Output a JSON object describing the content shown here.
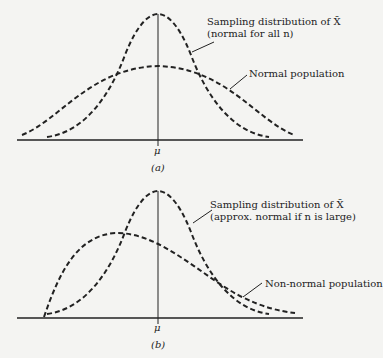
{
  "panels": [
    {
      "id": "a",
      "caption": "(a)",
      "axis_label": "μ",
      "sampling_label_line1": "Sampling distribution of X̄",
      "sampling_label_line2": "(normal for all n)",
      "population_label": "Normal population"
    },
    {
      "id": "b",
      "caption": "(b)",
      "axis_label": "μ",
      "sampling_label_line1": "Sampling distribution of X̄",
      "sampling_label_line2": "(approx. normal if n is large)",
      "population_label": "Non-normal population"
    }
  ],
  "colors": {
    "ink": "#222222",
    "background": "#f4f4f2"
  }
}
